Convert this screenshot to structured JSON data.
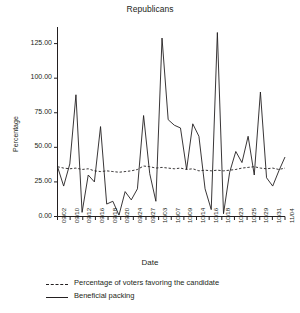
{
  "chart_data": {
    "type": "line",
    "title": "Republicans",
    "xlabel": "Date",
    "ylabel": "Percentage",
    "ylim": [
      0,
      137
    ],
    "yticks": [
      0,
      25,
      50,
      75,
      100,
      125
    ],
    "ytick_labels": [
      "0.00",
      "25.00",
      "50.00",
      "75.00",
      "100.00",
      "125.00"
    ],
    "grid": false,
    "legend_position": "below",
    "categories": [
      "09/02",
      "09/03",
      "09/08",
      "09/10",
      "09/11",
      "09/12",
      "09/15",
      "09/16",
      "09/17",
      "09/18",
      "09/19",
      "09/20",
      "09/23",
      "09/24",
      "09/25",
      "09/27",
      "09/30",
      "10/03",
      "10/06",
      "10/07",
      "10/08",
      "10/09",
      "10/13",
      "10/14",
      "10/15",
      "10/16",
      "10/17",
      "10/18",
      "10/21",
      "10/23",
      "10/24",
      "10/25",
      "10/28",
      "10/29",
      "10/30",
      "10/31",
      "11/03",
      "11/04"
    ],
    "xtick_labels": [
      "09/02",
      "09/10",
      "09/12",
      "09/16",
      "09/18",
      "09/20",
      "09/24",
      "09/27",
      "10/03",
      "10/07",
      "10/09",
      "10/14",
      "10/16",
      "10/18",
      "10/23",
      "10/25",
      "10/29",
      "10/31",
      "11/04"
    ],
    "series": [
      {
        "name": "Percentage of voters favoring the candidate",
        "style": "dashed",
        "color": "#231f20",
        "values": [
          36.0,
          35.0,
          34.5,
          35.0,
          34.0,
          34.5,
          33.0,
          32.5,
          33.0,
          32.5,
          32.0,
          32.5,
          33.0,
          34.0,
          36.5,
          36.0,
          35.0,
          35.5,
          35.0,
          34.5,
          35.0,
          34.0,
          34.5,
          33.0,
          33.5,
          33.0,
          33.5,
          33.0,
          33.5,
          34.0,
          35.0,
          35.5,
          36.0,
          35.0,
          34.5,
          35.0,
          34.0,
          35.0
        ]
      },
      {
        "name": "Beneficial packing",
        "style": "solid",
        "color": "#231f20",
        "values": [
          36.0,
          22.0,
          38.0,
          88.0,
          3.0,
          30.0,
          25.0,
          65.0,
          9.0,
          11.0,
          1.0,
          18.0,
          12.0,
          20.0,
          73.0,
          31.0,
          11.0,
          129.0,
          70.0,
          66.0,
          64.0,
          34.0,
          67.0,
          58.0,
          20.0,
          5.0,
          133.0,
          2.0,
          32.0,
          47.0,
          39.0,
          58.0,
          30.0,
          90.0,
          28.0,
          22.0,
          33.0,
          43.0
        ]
      }
    ]
  },
  "legend": {
    "items": [
      {
        "label": "Percentage of voters favoring the candidate",
        "style": "dashed"
      },
      {
        "label": "Beneficial packing",
        "style": "solid"
      }
    ]
  }
}
